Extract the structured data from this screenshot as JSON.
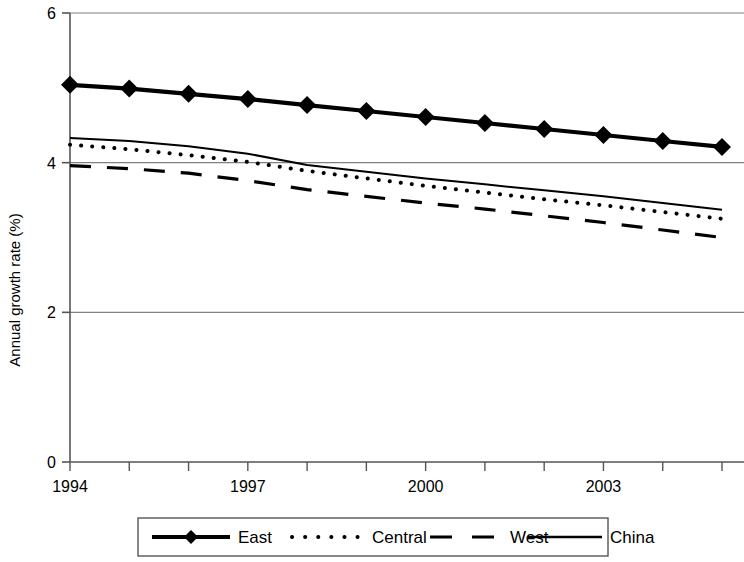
{
  "chart_data": {
    "type": "line",
    "title": "",
    "xlabel": "",
    "ylabel": "Annual growth rate (%)",
    "xlim": [
      1994,
      2005
    ],
    "ylim": [
      0,
      6
    ],
    "yticks": [
      0,
      2,
      4,
      6
    ],
    "ytick_labels": [
      "0",
      "2",
      "4",
      "6"
    ],
    "xticks": [
      1994,
      1995,
      1996,
      1997,
      1998,
      1999,
      2000,
      2001,
      2002,
      2003,
      2004,
      2005
    ],
    "xtick_labels": [
      "1994",
      "",
      "",
      "1997",
      "",
      "",
      "2000",
      "",
      "",
      "2003",
      "",
      ""
    ],
    "x": [
      1994,
      1995,
      1996,
      1997,
      1998,
      1999,
      2000,
      2001,
      2002,
      2003,
      2004,
      2005
    ],
    "grid": "horizontal",
    "legend_position": "bottom",
    "series": [
      {
        "name": "East",
        "style": "solid-thick-markers",
        "marker": "diamond",
        "color": "#000000",
        "values": [
          5.04,
          4.99,
          4.92,
          4.85,
          4.77,
          4.69,
          4.61,
          4.53,
          4.45,
          4.37,
          4.29,
          4.21
        ]
      },
      {
        "name": "Central",
        "style": "dotted",
        "marker": "none",
        "color": "#000000",
        "values": [
          4.24,
          4.18,
          4.1,
          4.01,
          3.89,
          3.79,
          3.69,
          3.6,
          3.51,
          3.43,
          3.34,
          3.25
        ]
      },
      {
        "name": "West",
        "style": "dashed",
        "marker": "none",
        "color": "#000000",
        "values": [
          3.96,
          3.92,
          3.86,
          3.76,
          3.64,
          3.55,
          3.46,
          3.38,
          3.29,
          3.2,
          3.1,
          3.0
        ]
      },
      {
        "name": "China",
        "style": "solid-thin",
        "marker": "none",
        "color": "#000000",
        "values": [
          4.33,
          4.29,
          4.22,
          4.12,
          3.97,
          3.88,
          3.79,
          3.71,
          3.63,
          3.55,
          3.46,
          3.37
        ]
      }
    ]
  },
  "legend": {
    "items": [
      {
        "label": "East",
        "key": "east"
      },
      {
        "label": "Central",
        "key": "central"
      },
      {
        "label": "West",
        "key": "west"
      },
      {
        "label": "China",
        "key": "china"
      }
    ]
  }
}
